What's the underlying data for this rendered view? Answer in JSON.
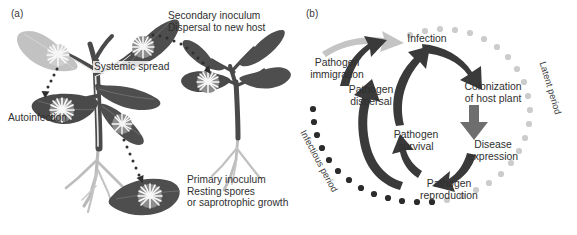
{
  "figure": {
    "panels": [
      {
        "id": "a",
        "label": "(a)",
        "title": "Plant disease inoculum dispersal diagram",
        "annotations": [
          {
            "name": "secondary-inoculum",
            "text": "Secondary inoculum\nDispersal to new host"
          },
          {
            "name": "systemic-spread",
            "text": "Systemic spread"
          },
          {
            "name": "autoinfection",
            "text": "Autoinfection"
          },
          {
            "name": "primary-inoculum",
            "text": "Primary inoculum\nResting spores\nor saprotrophic growth"
          }
        ]
      },
      {
        "id": "b",
        "label": "(b)",
        "title": "Pathogen disease cycle",
        "nodes": [
          {
            "name": "pathogen-immigration",
            "text": "Pathogen\nimmigration"
          },
          {
            "name": "infection",
            "text": "Infection"
          },
          {
            "name": "colonization-of-host-plant",
            "text": "Colonization\nof host plant"
          },
          {
            "name": "disease-expression",
            "text": "Disease\nexpression"
          },
          {
            "name": "pathogen-reproduction",
            "text": "Pathogen\nreproduction"
          },
          {
            "name": "pathogen-dispersal",
            "text": "Pathogen\ndispersal"
          },
          {
            "name": "pathogen-survival",
            "text": "Pathogen\nsurvival"
          }
        ],
        "arcs": [
          {
            "name": "latent-period",
            "text": "Latent period",
            "dot_color": "#c9c9c9"
          },
          {
            "name": "infectious-period",
            "text": "Infectious period",
            "dot_color": "#2b2b2b"
          }
        ]
      }
    ]
  },
  "colors": {
    "leaf_dark": "#4a4a4a",
    "leaf_mid": "#5e5e5e",
    "leaf_light": "#c2c2c2",
    "stem": "#4a4a4a",
    "root": "#b5b5b5",
    "lesion": "#f2f2f2",
    "arrow_dark": "#3c3c3c",
    "arrow_mid": "#6e6e6e",
    "arrow_light": "#c4c4c4",
    "text": "#2f2f2f"
  }
}
